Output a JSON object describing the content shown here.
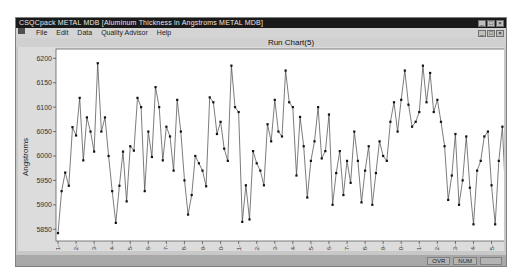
{
  "window": {
    "title": "CSQCpack   METAL MDB   [Aluminum Thickness in Angstroms   METAL MDB]",
    "controls": [
      "_",
      "□",
      "×"
    ]
  },
  "menubar": {
    "items": [
      "File",
      "Edit",
      "Data",
      "Quality Advisor",
      "Help"
    ],
    "doc_controls": [
      "_",
      "□",
      "×"
    ]
  },
  "statusbar": {
    "cells": [
      "OVR",
      "NUM",
      ""
    ]
  },
  "chart_data": {
    "type": "line",
    "title": "Run Chart(5)",
    "xlabel": "",
    "ylabel": "Angstroms",
    "ylim": [
      5830,
      6215
    ],
    "yticks": [
      5850,
      5900,
      5950,
      6000,
      6050,
      6100,
      6150,
      6200
    ],
    "xticks": [
      "1",
      "2",
      "3",
      "4",
      "5",
      "6",
      "7",
      "8",
      "9",
      "10",
      "11",
      "12",
      "13",
      "14",
      "15",
      "16",
      "17",
      "18",
      "19",
      "20",
      "21",
      "22",
      "23",
      "24",
      "25"
    ],
    "points_per_subgroup": 5,
    "grid": false,
    "marker": "dot",
    "series": [
      {
        "name": "Aluminum Thickness",
        "values": [
          5842,
          5928,
          5966,
          5939,
          6059,
          6042,
          6119,
          5991,
          6079,
          6050,
          6009,
          6190,
          6050,
          6079,
          6000,
          5928,
          5863,
          5939,
          6009,
          5907,
          6020,
          6011,
          6119,
          6100,
          5928,
          6050,
          5998,
          6141,
          6100,
          5991,
          6060,
          6040,
          5970,
          6115,
          6050,
          5950,
          5880,
          5920,
          6000,
          5985,
          5970,
          5938,
          6120,
          6110,
          6045,
          6070,
          6015,
          5990,
          6185,
          6100,
          6090,
          5865,
          5940,
          5870,
          6010,
          5985,
          5970,
          5940,
          6065,
          6030,
          6115,
          6050,
          6040,
          6175,
          6110,
          6100,
          5960,
          6080,
          6020,
          5915,
          5990,
          6030,
          6100,
          5995,
          6010,
          6085,
          5900,
          5965,
          6010,
          5920,
          5990,
          5945,
          6050,
          5990,
          5905,
          5970,
          6020,
          5900,
          5965,
          6030,
          6000,
          5990,
          6070,
          6110,
          6050,
          6115,
          6175,
          6105,
          6060,
          6070,
          6090,
          6185,
          6110,
          6170,
          6090,
          6115,
          6070,
          6020,
          5910,
          5960,
          6045,
          5900,
          5950,
          6040,
          5935,
          5860,
          5970,
          5990,
          6040,
          6050,
          5940,
          5860,
          5990,
          6060,
          5900
        ]
      }
    ]
  }
}
